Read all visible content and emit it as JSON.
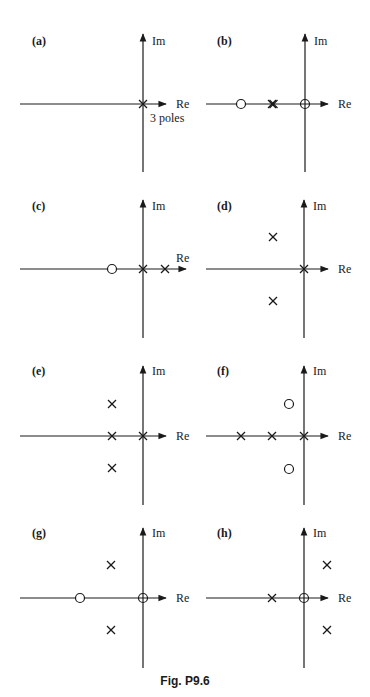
{
  "figure": {
    "caption": "Fig. P9.6",
    "axis_labels": {
      "real": "Re",
      "imag": "Im"
    },
    "plots": [
      {
        "id": "a",
        "label": "(a)",
        "annotation": "3 poles",
        "poles": [
          {
            "re": 0,
            "im": 0,
            "multiplicity": 3
          }
        ],
        "zeros": []
      },
      {
        "id": "b",
        "label": "(b)",
        "annotation": "",
        "poles": [
          {
            "re": -1,
            "im": 0,
            "multiplicity": 2
          }
        ],
        "zeros": [
          {
            "re": -3,
            "im": 0
          },
          {
            "re": 0,
            "im": 0
          }
        ]
      },
      {
        "id": "c",
        "label": "(c)",
        "annotation": "",
        "poles": [
          {
            "re": 0,
            "im": 0
          },
          {
            "re": 0.7,
            "im": 0
          }
        ],
        "zeros": [
          {
            "re": -1,
            "im": 0
          }
        ]
      },
      {
        "id": "d",
        "label": "(d)",
        "annotation": "",
        "poles": [
          {
            "re": 0,
            "im": 0
          },
          {
            "re": -1,
            "im": 1
          },
          {
            "re": -1,
            "im": -1
          }
        ],
        "zeros": []
      },
      {
        "id": "e",
        "label": "(e)",
        "annotation": "",
        "poles": [
          {
            "re": 0,
            "im": 0
          },
          {
            "re": -1,
            "im": 0
          },
          {
            "re": -1,
            "im": 1
          },
          {
            "re": -1,
            "im": -1
          }
        ],
        "zeros": []
      },
      {
        "id": "f",
        "label": "(f)",
        "annotation": "",
        "poles": [
          {
            "re": 0,
            "im": 0
          },
          {
            "re": -1,
            "im": 0
          },
          {
            "re": -2,
            "im": 0
          }
        ],
        "zeros": [
          {
            "re": -0.5,
            "im": 1
          },
          {
            "re": -0.5,
            "im": -1
          }
        ]
      },
      {
        "id": "g",
        "label": "(g)",
        "annotation": "",
        "poles": [
          {
            "re": -1,
            "im": 1
          },
          {
            "re": -1,
            "im": -1
          }
        ],
        "zeros": [
          {
            "re": 0,
            "im": 0
          },
          {
            "re": -2,
            "im": 0
          }
        ]
      },
      {
        "id": "h",
        "label": "(h)",
        "annotation": "",
        "poles": [
          {
            "re": -1,
            "im": 0
          },
          {
            "re": 0.7,
            "im": 1
          },
          {
            "re": 0.7,
            "im": -1
          }
        ],
        "zeros": [
          {
            "re": 0,
            "im": 0
          }
        ]
      }
    ]
  }
}
